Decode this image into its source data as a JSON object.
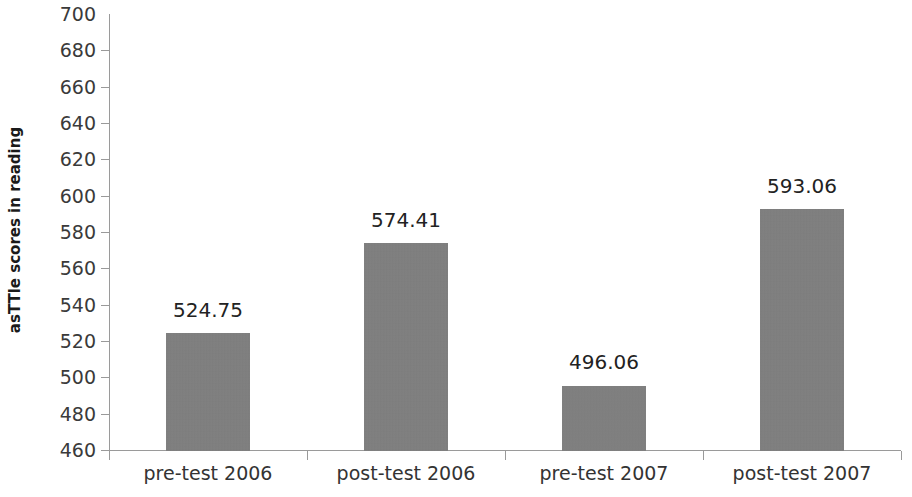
{
  "chart_data": {
    "type": "bar",
    "title": "",
    "subtitle": "",
    "xlabel": "",
    "ylabel": "asTTle scores in reading",
    "categories": [
      "pre-test 2006",
      "post-test 2006",
      "pre-test 2007",
      "post-test 2007"
    ],
    "values": [
      524.75,
      574.41,
      496.06,
      593.06
    ],
    "value_labels": [
      "524.75",
      "574.41",
      "496.06",
      "593.06"
    ],
    "ylim": [
      460,
      700
    ],
    "ytick_values": [
      460,
      480,
      500,
      520,
      540,
      560,
      580,
      600,
      620,
      640,
      660,
      680,
      700
    ],
    "ytick_labels": [
      "460",
      "480",
      "500",
      "520",
      "540",
      "560",
      "580",
      "600",
      "620",
      "640",
      "660",
      "680",
      "700"
    ],
    "grid": false,
    "legend": false,
    "legend_position": "none",
    "bar_color": "#808080",
    "axis_color": "#9a9a9a",
    "text_color": "#333333"
  }
}
